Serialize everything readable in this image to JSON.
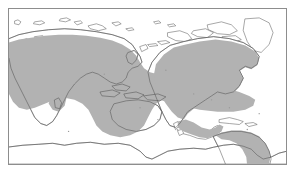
{
  "figure": {
    "kind": "world-distribution-map",
    "projection": "pacific-centered equirectangular",
    "background_color": "#ffffff",
    "frame_color": "#8d8d8d",
    "coastline_color": "#5f5f5f",
    "range_fill_color": "#b2b2b2",
    "land_fill_color": "#ffffff",
    "title": "",
    "caption": "",
    "legend_visible": false,
    "labels_visible": false,
    "gridlines_visible": false
  },
  "frame": {
    "left": 8,
    "top": 8,
    "width": 279,
    "height": 157,
    "border_width": 1
  },
  "range": {
    "name": "shaded-distribution-range",
    "fill": "#b2b2b2",
    "regions": [
      "Europe and Mediterranean",
      "northern and central Africa",
      "Middle East",
      "southern and eastern Asia",
      "Indian Ocean",
      "Indonesia and Southeast Asia",
      "northern and eastern Australia",
      "equatorial Pacific corridor",
      "southern North America",
      "Central America and Caribbean",
      "western and eastern South America"
    ]
  },
  "landmasses": [
    {
      "name": "eurasia-africa"
    },
    {
      "name": "australia"
    },
    {
      "name": "north-america"
    },
    {
      "name": "south-america"
    },
    {
      "name": "greenland"
    },
    {
      "name": "antarctica"
    },
    {
      "name": "arctic-islands"
    },
    {
      "name": "new-zealand"
    },
    {
      "name": "indonesia-archipelago"
    },
    {
      "name": "japan"
    },
    {
      "name": "british-isles"
    },
    {
      "name": "madagascar"
    }
  ],
  "notes": {
    "antarctica_shaded": "no",
    "arctic_shaded": "no",
    "north_pacific_shaded": "no"
  }
}
